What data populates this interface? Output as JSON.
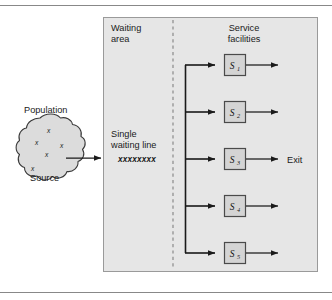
{
  "figure": {
    "title_alt": "Single-queue multiple-server queueing system diagram",
    "colors": {
      "panel_fill": "#e6e6e6",
      "panel_stroke": "#9a9a9a",
      "server_fill": "#d4d4d4",
      "server_stroke": "#4a4a4a",
      "cloud_fill": "#dcdcdc",
      "cloud_stroke": "#3a3a3a",
      "line": "#1a1a1a",
      "rule": "#777777",
      "dashed_divider": "#8a8a8a"
    }
  },
  "rules": {
    "top_rule": "",
    "bottom_rule": ""
  },
  "population": {
    "title": "Population",
    "source_label": "Source",
    "members": [
      "x",
      "x",
      "x",
      "x",
      "x"
    ]
  },
  "panel": {
    "waiting": {
      "heading_line1": "Waiting",
      "heading_line2": "area",
      "queue_line1": "Single",
      "queue_line2": "waiting line",
      "queue_items": "xxxxxxxx"
    },
    "service": {
      "heading_line1": "Service",
      "heading_line2": "facilities",
      "exit_label": "Exit",
      "servers": [
        {
          "symbol": "S",
          "subscript": "1"
        },
        {
          "symbol": "S",
          "subscript": "2"
        },
        {
          "symbol": "S",
          "subscript": "3"
        },
        {
          "symbol": "S",
          "subscript": "4"
        },
        {
          "symbol": "S",
          "subscript": "5"
        }
      ]
    }
  }
}
